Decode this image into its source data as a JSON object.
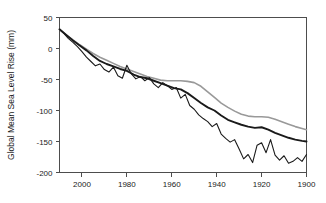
{
  "chart_data": {
    "type": "line",
    "title": "",
    "xlabel": "",
    "ylabel": "Global Mean Sea Level Rise (mm)",
    "xlim": [
      2010,
      1900
    ],
    "ylim": [
      -200,
      50
    ],
    "x_reversed": true,
    "grid": false,
    "legend": "none",
    "xticks": [
      2000,
      1980,
      1960,
      1940,
      1920,
      1900
    ],
    "xticklabels": [
      "2000",
      "1980",
      "1960",
      "1940",
      "1920",
      "1900"
    ],
    "yticks": [
      50,
      0,
      -50,
      -100,
      -150,
      -200
    ],
    "yticklabels": [
      "50",
      "0",
      "-50",
      "-100",
      "-150",
      "-200"
    ],
    "series": [
      {
        "name": "smooth-gray-reconstruction",
        "color": "#999999",
        "width": 1.6,
        "x": [
          2010,
          2007,
          2004,
          2001,
          1998,
          1995,
          1992,
          1989,
          1986,
          1983,
          1980,
          1977,
          1974,
          1971,
          1968,
          1965,
          1962,
          1959,
          1956,
          1953,
          1950,
          1947,
          1944,
          1941,
          1938,
          1935,
          1932,
          1929,
          1926,
          1923,
          1920,
          1917,
          1914,
          1911,
          1908,
          1905,
          1902,
          1900
        ],
        "y": [
          31,
          22,
          14,
          6,
          -1,
          -8,
          -14,
          -19,
          -24,
          -29,
          -33,
          -37,
          -41,
          -45,
          -48,
          -51,
          -52,
          -52,
          -52,
          -53,
          -55,
          -61,
          -70,
          -79,
          -88,
          -95,
          -101,
          -106,
          -109,
          -110,
          -110,
          -111,
          -114,
          -118,
          -122,
          -126,
          -129,
          -131
        ]
      },
      {
        "name": "thick-black-smoothed",
        "color": "#1a1a1a",
        "width": 1.9,
        "x": [
          2010,
          2007,
          2004,
          2001,
          1998,
          1995,
          1992,
          1989,
          1986,
          1983,
          1980,
          1977,
          1974,
          1971,
          1968,
          1965,
          1962,
          1959,
          1956,
          1953,
          1950,
          1947,
          1944,
          1941,
          1938,
          1935,
          1932,
          1929,
          1926,
          1923,
          1920,
          1917,
          1914,
          1911,
          1908,
          1905,
          1902,
          1900
        ],
        "y": [
          31,
          22,
          13,
          5,
          -3,
          -12,
          -20,
          -25,
          -29,
          -33,
          -36,
          -42,
          -46,
          -48,
          -52,
          -56,
          -60,
          -64,
          -66,
          -72,
          -80,
          -88,
          -95,
          -100,
          -108,
          -115,
          -119,
          -123,
          -126,
          -128,
          -127,
          -131,
          -136,
          -140,
          -144,
          -147,
          -149,
          -150
        ]
      },
      {
        "name": "noisy-black-annual",
        "color": "#1a1a1a",
        "width": 1.1,
        "x": [
          2010,
          2008,
          2006,
          2004,
          2002,
          2000,
          1998,
          1996,
          1994,
          1992,
          1990,
          1988,
          1986,
          1984,
          1982,
          1980,
          1978,
          1976,
          1974,
          1972,
          1970,
          1968,
          1966,
          1964,
          1962,
          1960,
          1958,
          1956,
          1954,
          1952,
          1950,
          1948,
          1946,
          1944,
          1942,
          1940,
          1938,
          1936,
          1934,
          1932,
          1930,
          1928,
          1926,
          1924,
          1922,
          1920,
          1918,
          1916,
          1914,
          1912,
          1910,
          1908,
          1906,
          1904,
          1902,
          1900
        ],
        "y": [
          31,
          24,
          16,
          10,
          3,
          -5,
          -14,
          -21,
          -28,
          -25,
          -34,
          -38,
          -30,
          -44,
          -48,
          -27,
          -41,
          -49,
          -45,
          -52,
          -47,
          -57,
          -63,
          -55,
          -60,
          -66,
          -63,
          -80,
          -74,
          -92,
          -98,
          -107,
          -113,
          -118,
          -126,
          -121,
          -138,
          -145,
          -151,
          -147,
          -162,
          -178,
          -171,
          -184,
          -156,
          -152,
          -168,
          -147,
          -172,
          -180,
          -173,
          -185,
          -182,
          -176,
          -182,
          -171
        ]
      }
    ]
  }
}
